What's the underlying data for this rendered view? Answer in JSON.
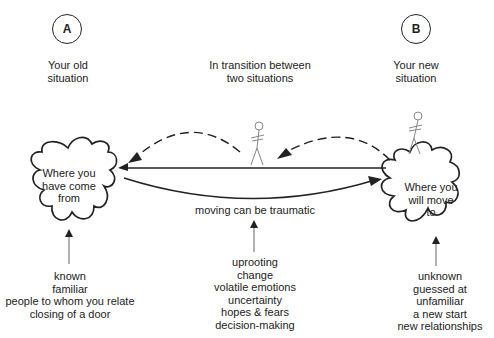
{
  "markers": {
    "a": "A",
    "b": "B"
  },
  "headings": {
    "old_situation": [
      "Your old",
      "situation"
    ],
    "transition": [
      "In transition between",
      "two situations"
    ],
    "new_situation": [
      "Your new",
      "situation"
    ]
  },
  "blobs": {
    "origin": [
      "Where you",
      "have come",
      "from"
    ],
    "destination": [
      "Where you",
      "will move",
      "to"
    ]
  },
  "center_label": "moving can be traumatic",
  "lists": {
    "old": [
      "known",
      "familiar",
      "people to whom you relate",
      "closing of a door"
    ],
    "transition": [
      "uprooting",
      "change",
      "volatile emotions",
      "uncertainty",
      "hopes & fears",
      "decision-making"
    ],
    "new": [
      "unknown",
      "guessed at",
      "unfamiliar",
      "a new start",
      "new relationships"
    ]
  },
  "colors": {
    "ink": "#222222",
    "figure": "#888888",
    "background": "#ffffff"
  }
}
